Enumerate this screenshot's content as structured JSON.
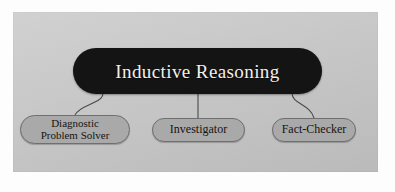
{
  "diagram": {
    "type": "hierarchy-tree",
    "panel": {
      "background_color": "#c9c9c9"
    },
    "root": {
      "label": "Inductive Reasoning",
      "fill_color": "#141414",
      "text_color": "#f2f0ec",
      "shape": "rounded-pill"
    },
    "children": [
      {
        "label": "Diagnostic\nProblem Solver",
        "fill_color": "#a9a9a9",
        "border_color": "#6f6f6f",
        "text_color": "#17140f",
        "shape": "rounded-pill",
        "connector": "curve-left"
      },
      {
        "label": "Investigator",
        "fill_color": "#a9a9a9",
        "border_color": "#6f6f6f",
        "text_color": "#17140f",
        "shape": "rounded-pill",
        "connector": "straight-vertical"
      },
      {
        "label": "Fact-Checker",
        "fill_color": "#a9a9a9",
        "border_color": "#6f6f6f",
        "text_color": "#17140f",
        "shape": "rounded-pill",
        "connector": "curve-right"
      }
    ],
    "connector_color": "#4a4a4a"
  }
}
